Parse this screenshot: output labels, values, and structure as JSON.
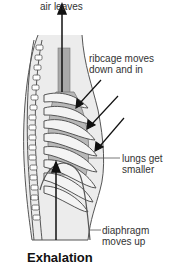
{
  "diagram": {
    "title": "Exhalation",
    "labels": {
      "air": "air leaves",
      "ribcage_line1": "ribcage moves",
      "ribcage_line2": "down and in",
      "lungs_line1": "lungs get",
      "lungs_line2": "smaller",
      "diaphragm_line1": "diaphragm",
      "diaphragm_line2": "moves up"
    },
    "colors": {
      "outline": "#555555",
      "body_fill": "#ececec",
      "lung_fill": "#b8b8b8",
      "trachea_fill": "#a9a9a9",
      "arrow": "#111111",
      "text": "#333333"
    }
  }
}
